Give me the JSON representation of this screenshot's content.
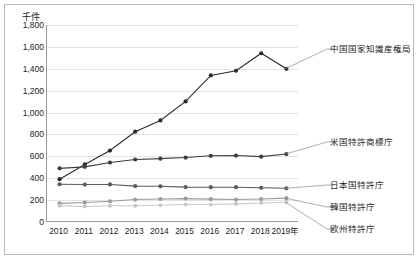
{
  "chart_data": {
    "type": "line",
    "title": "",
    "unit_label": "千件",
    "xlabel": "",
    "ylabel": "",
    "x": [
      "2010",
      "2011",
      "2012",
      "2013",
      "2014",
      "2015",
      "2016",
      "2017",
      "2018",
      "2019年"
    ],
    "categories": [
      "2010",
      "2011",
      "2012",
      "2013",
      "2014",
      "2015",
      "2016",
      "2017",
      "2018",
      "2019年"
    ],
    "ylim": [
      0,
      1800
    ],
    "yticks": [
      "0",
      "200",
      "400",
      "600",
      "800",
      "1,000",
      "1,200",
      "1,400",
      "1,600",
      "1,800"
    ],
    "ytick_values": [
      0,
      200,
      400,
      600,
      800,
      1000,
      1200,
      1400,
      1600,
      1800
    ],
    "grid": true,
    "legend_position": "right-annotations",
    "series": [
      {
        "name": "中国国家知識産権局",
        "color": "#2b2b2b",
        "values": [
          391,
          526,
          653,
          825,
          928,
          1102,
          1339,
          1382,
          1542,
          1400
        ]
      },
      {
        "name": "米国特許商標庁",
        "color": "#3d3d3d",
        "values": [
          490,
          504,
          543,
          571,
          579,
          589,
          605,
          607,
          597,
          621
        ]
      },
      {
        "name": "日本国特許庁",
        "color": "#5a5a5a",
        "values": [
          345,
          342,
          343,
          328,
          326,
          319,
          318,
          318,
          313,
          308
        ]
      },
      {
        "name": "韓国特許庁",
        "color": "#9b9b9b",
        "values": [
          170,
          178,
          189,
          205,
          210,
          214,
          209,
          205,
          210,
          218
        ]
      },
      {
        "name": "欧州特許庁",
        "color": "#c9c9c9",
        "values": [
          150,
          142,
          148,
          148,
          153,
          160,
          160,
          166,
          174,
          181
        ]
      }
    ],
    "annotations": [
      {
        "text": "中国国家知識産権局",
        "series": "中国国家知識産権局"
      },
      {
        "text": "米国特許商標庁",
        "series": "米国特許商標庁"
      },
      {
        "text": "日本国特許庁",
        "series": "日本国特許庁"
      },
      {
        "text": "韓国特許庁",
        "series": "韓国特許庁"
      },
      {
        "text": "欧州特許庁",
        "series": "欧州特許庁"
      }
    ]
  },
  "annotation_labels": {
    "china": "中国国家知識産権局",
    "usa": "米国特許商標庁",
    "japan": "日本国特許庁",
    "korea": "韓国特許庁",
    "europe": "欧州特許庁"
  }
}
